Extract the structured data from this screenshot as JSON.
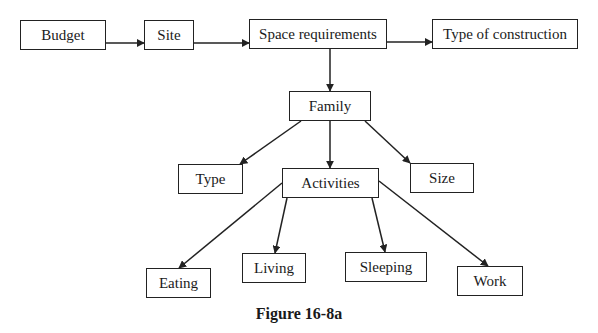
{
  "diagram": {
    "type": "flowchart",
    "caption": "Figure 16-8a",
    "nodes": [
      {
        "id": "budget",
        "label": "Budget",
        "x": 20,
        "y": 20,
        "w": 86,
        "h": 30
      },
      {
        "id": "site",
        "label": "Site",
        "x": 144,
        "y": 20,
        "w": 50,
        "h": 30
      },
      {
        "id": "space",
        "label": "Space requirements",
        "x": 249,
        "y": 19,
        "w": 138,
        "h": 30
      },
      {
        "id": "construction",
        "label": "Type of construction",
        "x": 432,
        "y": 19,
        "w": 146,
        "h": 30
      },
      {
        "id": "family",
        "label": "Family",
        "x": 289,
        "y": 91,
        "w": 82,
        "h": 30
      },
      {
        "id": "type",
        "label": "Type",
        "x": 178,
        "y": 164,
        "w": 65,
        "h": 30
      },
      {
        "id": "activities",
        "label": "Activities",
        "x": 282,
        "y": 168,
        "w": 97,
        "h": 30
      },
      {
        "id": "size",
        "label": "Size",
        "x": 410,
        "y": 163,
        "w": 64,
        "h": 30
      },
      {
        "id": "eating",
        "label": "Eating",
        "x": 146,
        "y": 268,
        "w": 65,
        "h": 30
      },
      {
        "id": "living",
        "label": "Living",
        "x": 242,
        "y": 253,
        "w": 64,
        "h": 30
      },
      {
        "id": "sleeping",
        "label": "Sleeping",
        "x": 345,
        "y": 252,
        "w": 82,
        "h": 30
      },
      {
        "id": "work",
        "label": "Work",
        "x": 457,
        "y": 266,
        "w": 66,
        "h": 30
      }
    ],
    "edges": [
      {
        "from": "budget",
        "to": "site",
        "x1": 106,
        "y1": 43,
        "x2": 144,
        "y2": 43
      },
      {
        "from": "site",
        "to": "space",
        "x1": 194,
        "y1": 43,
        "x2": 249,
        "y2": 43
      },
      {
        "from": "space",
        "to": "construction",
        "x1": 387,
        "y1": 42,
        "x2": 432,
        "y2": 42
      },
      {
        "from": "space",
        "to": "family",
        "x1": 330,
        "y1": 49,
        "x2": 330,
        "y2": 91
      },
      {
        "from": "family",
        "to": "type",
        "x1": 301,
        "y1": 121,
        "x2": 240,
        "y2": 164
      },
      {
        "from": "family",
        "to": "activities",
        "x1": 330,
        "y1": 121,
        "x2": 330,
        "y2": 168
      },
      {
        "from": "family",
        "to": "size",
        "x1": 365,
        "y1": 121,
        "x2": 410,
        "y2": 163
      },
      {
        "from": "activities",
        "to": "eating",
        "x1": 282,
        "y1": 183,
        "x2": 179,
        "y2": 268
      },
      {
        "from": "activities",
        "to": "living",
        "x1": 287,
        "y1": 198,
        "x2": 275,
        "y2": 253
      },
      {
        "from": "activities",
        "to": "sleeping",
        "x1": 372,
        "y1": 198,
        "x2": 385,
        "y2": 252
      },
      {
        "from": "activities",
        "to": "work",
        "x1": 379,
        "y1": 181,
        "x2": 488,
        "y2": 266
      }
    ]
  }
}
